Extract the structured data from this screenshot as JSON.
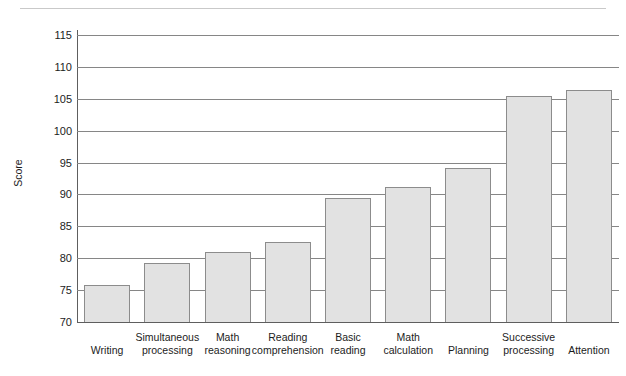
{
  "figure": {
    "y_axis_title": "Score"
  },
  "chart_data": {
    "type": "bar",
    "title": "",
    "xlabel": "",
    "ylabel": "Score",
    "ylim": [
      70,
      115
    ],
    "ytick_step": 5,
    "yticks": [
      70,
      75,
      80,
      85,
      90,
      95,
      100,
      105,
      110,
      115
    ],
    "ytick_labels": [
      "70",
      "75",
      "80",
      "85",
      "90",
      "95",
      "100",
      "105",
      "110",
      "115"
    ],
    "grid": true,
    "legend": "none",
    "orientation": "vertical",
    "bar_fill_color": "#e2e2e2",
    "bar_border_color": "#8c8c8c",
    "categories": [
      "Writing",
      "Simultaneous processing",
      "Math reasoning",
      "Reading comprehension",
      "Basic reading",
      "Math calculation",
      "Planning",
      "Successive processing",
      "Attention"
    ],
    "category_label_lines": [
      [
        "Writing"
      ],
      [
        "Simultaneous",
        "processing"
      ],
      [
        "Math",
        "reasoning"
      ],
      [
        "Reading",
        "comprehension"
      ],
      [
        "Basic",
        "reading"
      ],
      [
        "Math",
        "calculation"
      ],
      [
        "Planning"
      ],
      [
        "Successive",
        "processing"
      ],
      [
        "Attention"
      ]
    ],
    "values": [
      75.8,
      79.2,
      81.0,
      82.5,
      89.4,
      91.2,
      94.2,
      105.4,
      106.3
    ]
  }
}
